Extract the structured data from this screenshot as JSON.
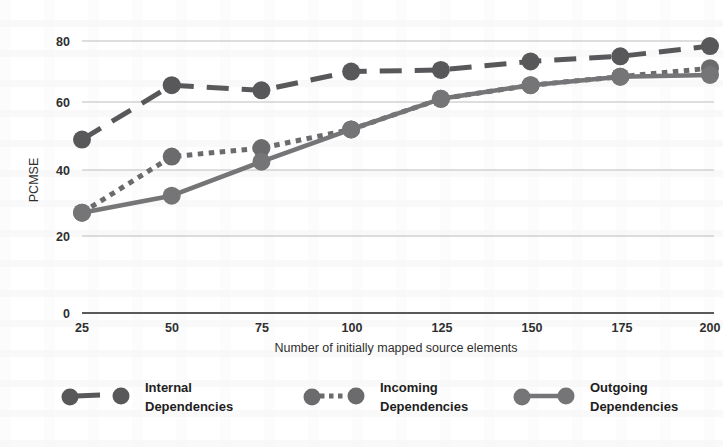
{
  "chart_data": {
    "type": "line",
    "title": "",
    "xlabel": "Number of initially mapped source elements",
    "ylabel": "PCMSE",
    "x": [
      25,
      50,
      75,
      100,
      125,
      150,
      175,
      200
    ],
    "xtick_labels": [
      "25",
      "50",
      "75",
      "100",
      "125",
      "150",
      "175",
      "200"
    ],
    "ytick_labels": [
      "0",
      "20",
      "40",
      "60",
      "80"
    ],
    "yticks": [
      0,
      20,
      40,
      60,
      80
    ],
    "ylim": [
      0,
      86
    ],
    "xlim": [
      25,
      200
    ],
    "grid": "horizontal",
    "legend_position": "bottom",
    "series": [
      {
        "name": "Internal Dependencies",
        "style": "dashed",
        "color": "#58585a",
        "values": [
          51,
          67,
          65.5,
          71,
          71.5,
          74,
          75.5,
          78.5
        ]
      },
      {
        "name": "Incoming Dependencies",
        "style": "dotted",
        "color": "#6b6b6d",
        "values": [
          29.5,
          46,
          48.5,
          54,
          63,
          67,
          69.5,
          72
        ]
      },
      {
        "name": "Outgoing Dependencies",
        "style": "solid",
        "color": "#757577",
        "values": [
          29.5,
          34.5,
          44.5,
          54,
          63,
          67,
          69.5,
          70
        ]
      }
    ]
  },
  "axes": {
    "y_label": "PCMSE",
    "x_label": "Number of initially mapped source elements",
    "y_ticks": [
      "80",
      "60",
      "40",
      "20",
      "0"
    ],
    "x_ticks": [
      "25",
      "50",
      "75",
      "100",
      "125",
      "150",
      "175",
      "200"
    ]
  },
  "legend": {
    "items": [
      {
        "line1": "Internal",
        "line2": "Dependencies",
        "style": "dashed"
      },
      {
        "line1": "Incoming",
        "line2": "Dependencies",
        "style": "dotted"
      },
      {
        "line1": "Outgoing",
        "line2": "Dependencies",
        "style": "solid"
      }
    ]
  },
  "colors": {
    "marker": "#58585a",
    "grid": "#b9b9bb",
    "axis": "#5a5a5c",
    "text": "#2f2f2f"
  }
}
